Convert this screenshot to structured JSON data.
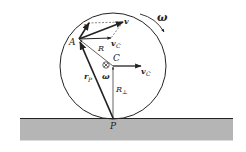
{
  "diagram": {
    "type": "rolling-wheel-kinematics",
    "colors": {
      "background": "#ffffff",
      "ground_fill": "#b5b5b5",
      "stroke": "#222222"
    },
    "labels": {
      "omega_top": "ω",
      "omega_center": "ω",
      "point_A": "A",
      "point_C": "C",
      "point_P": "P",
      "radius_R": "R",
      "velocity_v": "v",
      "velocity_v_prime": "v′",
      "velocity_vC_at_A": "v",
      "velocity_vC_at_A_sub": "C",
      "velocity_vC_at_C": "v",
      "velocity_vC_at_C_sub": "C",
      "position_rP": "r",
      "position_rP_sub": "P",
      "perp_R": "R",
      "perp_R_sub": "⊥"
    }
  }
}
